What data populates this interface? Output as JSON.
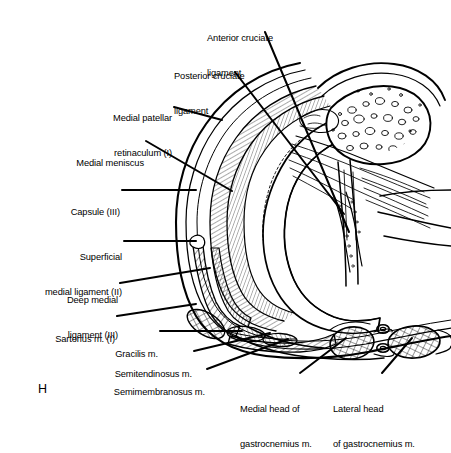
{
  "figure": {
    "panel_letter": "H",
    "ink_color": "#000000",
    "background_color": "#ffffff"
  },
  "labels": [
    {
      "id": "anterior-cruciate-ligament",
      "line1": "Anterior cruciate",
      "line2": "ligament"
    },
    {
      "id": "posterior-cruciate-ligament",
      "line1": "Posterior cruciate",
      "line2": "ligament"
    },
    {
      "id": "medial-patellar-retinaculum",
      "line1": "Medial patellar",
      "line2": "retinaculum (I)"
    },
    {
      "id": "medial-meniscus",
      "line1": "Medial meniscus",
      "line2": ""
    },
    {
      "id": "capsule",
      "line1": "Capsule (III)",
      "line2": ""
    },
    {
      "id": "superficial-medial-ligament",
      "line1": "Superficial",
      "line2": "medial ligament (II)"
    },
    {
      "id": "deep-medial-ligament",
      "line1": "Deep medial",
      "line2": "ligament (III)"
    },
    {
      "id": "sartorius-muscle",
      "line1": "Sartorius m. (I)",
      "line2": ""
    },
    {
      "id": "gracilis-muscle",
      "line1": "Gracilis m.",
      "line2": ""
    },
    {
      "id": "semitendinosus-muscle",
      "line1": "Semitendinosus m.",
      "line2": ""
    },
    {
      "id": "semimembranosus-muscle",
      "line1": "Semimembranosus m.",
      "line2": ""
    },
    {
      "id": "medial-head-gastrocnemius",
      "line1": "Medial head of",
      "line2": "gastrocnemius m."
    },
    {
      "id": "lateral-head-gastrocnemius",
      "line1": "Lateral head",
      "line2": "of gastrocnemius m."
    }
  ]
}
